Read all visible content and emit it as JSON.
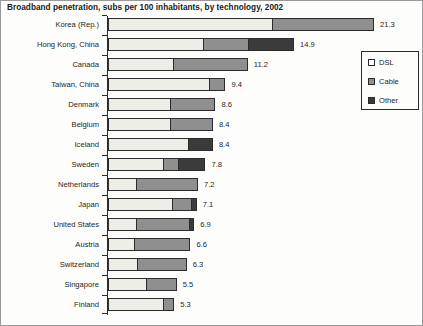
{
  "chart_data": {
    "type": "bar",
    "orientation": "horizontal",
    "stacked": true,
    "title": "Broadband penetration, subs per 100 inhabitants, by technology, 2002",
    "xlabel": "",
    "ylabel": "",
    "grid": false,
    "legend_position": "right",
    "xlim": [
      0,
      21.3
    ],
    "legend": [
      "DSL",
      "Cable",
      "Other"
    ],
    "categories": [
      "Korea (Rep.)",
      "Hong Kong, China",
      "Canada",
      "Taiwan, China",
      "Denmark",
      "Belgium",
      "Iceland",
      "Sweden",
      "Netherlands",
      "Japan",
      "United States",
      "Austria",
      "Switzerland",
      "Singapore",
      "Finland"
    ],
    "totals": [
      21.3,
      14.9,
      11.2,
      9.4,
      8.6,
      8.4,
      8.4,
      7.8,
      7.2,
      7.1,
      6.9,
      6.6,
      6.3,
      5.5,
      5.3
    ],
    "value_labels": [
      "21.3",
      "14.9",
      "11.2",
      "9.4",
      "8.6",
      "8.4",
      "8.4",
      "7.8",
      "7.2",
      "7.1",
      "6.9",
      "6.6",
      "6.3",
      "5.5",
      "5.3"
    ],
    "series": [
      {
        "name": "DSL",
        "color": "#eeeee8",
        "values": [
          13.2,
          7.7,
          5.2,
          8.2,
          5.0,
          5.0,
          6.5,
          4.5,
          2.2,
          5.3,
          2.3,
          2.1,
          2.3,
          3.1,
          4.5
        ]
      },
      {
        "name": "Cable",
        "color": "#8f8f8f",
        "values": [
          8.1,
          3.6,
          6.0,
          1.2,
          3.6,
          3.4,
          0.0,
          1.2,
          5.0,
          1.5,
          4.3,
          4.5,
          4.0,
          2.4,
          0.8
        ]
      },
      {
        "name": "Other",
        "color": "#3b3b3b",
        "values": [
          0.0,
          3.6,
          0.0,
          0.0,
          0.0,
          0.0,
          1.9,
          2.1,
          0.0,
          0.3,
          0.3,
          0.0,
          0.0,
          0.0,
          0.0
        ]
      }
    ]
  }
}
